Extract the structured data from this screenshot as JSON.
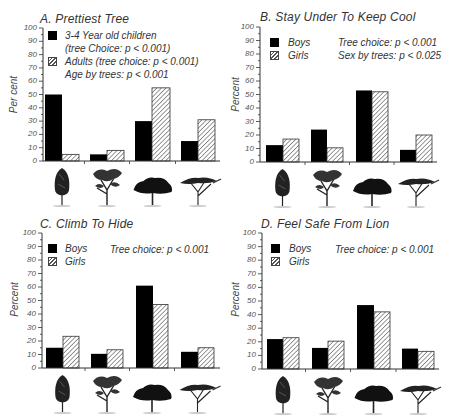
{
  "chart_data": [
    {
      "type": "bar",
      "title": "A. Prettiest Tree",
      "ylabel": "Per cent",
      "xlabel": "",
      "ylim": [
        0,
        100
      ],
      "yticks": [
        0,
        10,
        20,
        30,
        40,
        50,
        60,
        70,
        80,
        90,
        100
      ],
      "categories": [
        "columnar tree",
        "broad spreading tree",
        "dense wide-canopy tree",
        "flat-topped acacia"
      ],
      "series": [
        {
          "name": "3-4 Year old children",
          "style": "solid-black",
          "values": [
            50,
            5,
            30,
            15
          ]
        },
        {
          "name": "Adults",
          "style": "hatched",
          "values": [
            5,
            8,
            55,
            31
          ]
        }
      ],
      "legend": [
        {
          "label": "3-4 Year old children",
          "sub": "(tree Choice: p < 0.001)"
        },
        {
          "label": "Adults  (tree choice: p < 0.001)",
          "sub": "Age by trees: p < 0.001"
        }
      ],
      "annotations": []
    },
    {
      "type": "bar",
      "title": "B. Stay Under To Keep Cool",
      "ylabel": "Percent",
      "xlabel": "",
      "ylim": [
        0,
        100
      ],
      "yticks": [
        0,
        10,
        20,
        30,
        40,
        50,
        60,
        70,
        80,
        90,
        100
      ],
      "categories": [
        "columnar tree",
        "broad spreading tree",
        "dense wide-canopy tree",
        "flat-topped acacia"
      ],
      "series": [
        {
          "name": "Boys",
          "style": "solid-black",
          "values": [
            12.5,
            24,
            53,
            9
          ]
        },
        {
          "name": "Girls",
          "style": "hatched",
          "values": [
            17,
            10.5,
            52,
            20
          ]
        }
      ],
      "legend": [
        {
          "label": "Boys"
        },
        {
          "label": "Girls"
        }
      ],
      "annotations": [
        "Tree choice: p < 0.001",
        "Sex by trees: p < 0.025"
      ]
    },
    {
      "type": "bar",
      "title": "C. Climb To Hide",
      "ylabel": "Percent",
      "xlabel": "",
      "ylim": [
        0,
        100
      ],
      "yticks": [
        0,
        10,
        20,
        30,
        40,
        50,
        60,
        70,
        80,
        90,
        100
      ],
      "categories": [
        "columnar tree",
        "broad spreading tree",
        "dense wide-canopy tree",
        "flat-topped acacia"
      ],
      "series": [
        {
          "name": "Boys",
          "style": "solid-black",
          "values": [
            15,
            10.5,
            61,
            12
          ]
        },
        {
          "name": "Girls",
          "style": "hatched",
          "values": [
            23.5,
            13.5,
            47,
            15
          ]
        }
      ],
      "legend": [
        {
          "label": "Boys"
        },
        {
          "label": "Girls"
        }
      ],
      "annotations": [
        "Tree choice: p < 0.001"
      ]
    },
    {
      "type": "bar",
      "title": "D. Feel Safe From Lion",
      "ylabel": "Percent",
      "xlabel": "",
      "ylim": [
        0,
        100
      ],
      "yticks": [
        0,
        10,
        20,
        30,
        40,
        50,
        60,
        70,
        80,
        90,
        100
      ],
      "categories": [
        "columnar tree",
        "broad spreading tree",
        "dense wide-canopy tree",
        "flat-topped acacia"
      ],
      "series": [
        {
          "name": "Boys",
          "style": "solid-black",
          "values": [
            22,
            15.5,
            47,
            15
          ]
        },
        {
          "name": "Girls",
          "style": "hatched",
          "values": [
            23,
            20.5,
            42,
            13
          ]
        }
      ],
      "legend": [
        {
          "label": "Boys"
        },
        {
          "label": "Girls"
        }
      ],
      "annotations": [
        "Tree choice: p < 0.001"
      ]
    }
  ],
  "colors": {
    "series1": "#000000",
    "series2_hatch": "#555555",
    "axis": "#333333",
    "text": "#333333"
  }
}
